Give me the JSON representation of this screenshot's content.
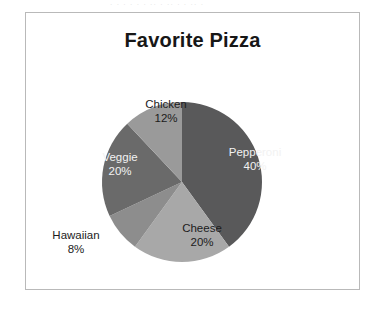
{
  "page": {
    "top_scan_fragment": "· · ·  · · ·   ·· ·  ·· ·   · ·· ·"
  },
  "panel": {
    "title": "Favorite Pizza",
    "border_color": "#b9b9b9",
    "background_color": "#ffffff"
  },
  "chart_data": {
    "type": "pie",
    "title": "Favorite Pizza",
    "xlabel": "",
    "ylabel": "",
    "legend_position": "none",
    "labels_inside": true,
    "categories": [
      "Pepperoni",
      "Cheese",
      "Hawaiian",
      "Veggie",
      "Chicken"
    ],
    "values": [
      40,
      20,
      8,
      20,
      12
    ],
    "value_unit": "%",
    "start_angle_deg": 0,
    "direction": "clockwise",
    "colors": [
      "#59595a",
      "#a8a8a8",
      "#8d8d8d",
      "#6a6a6a",
      "#9a9a9a"
    ],
    "slices": [
      {
        "name": "Pepperoni",
        "value": 40,
        "label": "Pepperoni",
        "percent_label": "40%",
        "color": "#59595a",
        "label_color": "#f2f2f2"
      },
      {
        "name": "Cheese",
        "value": 20,
        "label": "Cheese",
        "percent_label": "20%",
        "color": "#a8a8a8",
        "label_color": "#1c1c1c"
      },
      {
        "name": "Hawaiian",
        "value": 8,
        "label": "Hawaiian",
        "percent_label": "8%",
        "color": "#8d8d8d",
        "label_color": "#1c1c1c"
      },
      {
        "name": "Veggie",
        "value": 20,
        "label": "Veggie",
        "percent_label": "20%",
        "color": "#6a6a6a",
        "label_color": "#f2f2f2"
      },
      {
        "name": "Chicken",
        "value": 12,
        "label": "Chicken",
        "percent_label": "12%",
        "color": "#9a9a9a",
        "label_color": "#1c1c1c"
      }
    ]
  }
}
